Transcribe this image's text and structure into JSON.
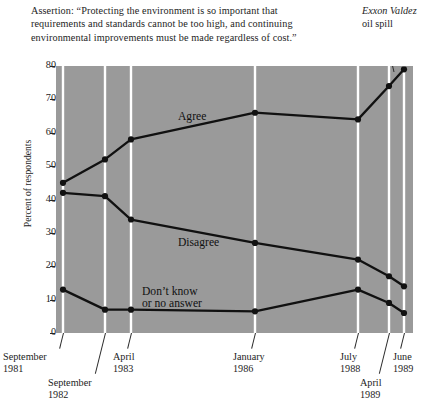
{
  "assertion": {
    "text": "Assertion: “Protecting the environment is so important that requirements and standards cannot be too high, and continuing environmental improvements must be made regardless of cost.”"
  },
  "annotation": {
    "title_italic": "Exxon Valdez",
    "title_rest": "oil spill"
  },
  "chart_data": {
    "type": "line",
    "title": "",
    "xlabel": "",
    "ylabel": "Percent of respondents",
    "ylim": [
      0,
      80
    ],
    "yticks": [
      0,
      10,
      20,
      30,
      40,
      50,
      60,
      70,
      80
    ],
    "grid": "vertical-white-gridlines",
    "legend": "inline-labels",
    "plot_background": "#9a9a9a",
    "line_color": "#111111",
    "gridline_color": "#ffffff",
    "categories": [
      "September 1981",
      "September 1982",
      "April 1983",
      "January 1986",
      "July 1988",
      "April 1989",
      "June 1989"
    ],
    "x_positions_px": [
      7,
      49,
      75,
      199,
      302,
      333,
      348
    ],
    "series": [
      {
        "name": "Agree",
        "label": "Agree",
        "values": [
          45,
          52,
          58,
          66,
          64,
          74,
          79
        ]
      },
      {
        "name": "Disagree",
        "label": "Disagree",
        "values": [
          42,
          41,
          34,
          27,
          22,
          17,
          14
        ]
      },
      {
        "name": "Don't know or no answer",
        "label_line1": "Don’t know",
        "label_line2": "or no answer",
        "values": [
          13,
          7,
          7,
          6.5,
          13,
          9,
          6
        ]
      }
    ],
    "annotations": [
      {
        "text": "Exxon Valdez oil spill",
        "points_to": "April 1989"
      }
    ]
  },
  "xaxis": {
    "labels": [
      {
        "line1": "September",
        "line2": "1981"
      },
      {
        "line1": "September",
        "line2": "1982"
      },
      {
        "line1": "April",
        "line2": "1983"
      },
      {
        "line1": "January",
        "line2": "1986"
      },
      {
        "line1": "July",
        "line2": "1988"
      },
      {
        "line1": "April",
        "line2": "1989"
      },
      {
        "line1": "June",
        "line2": "1989"
      }
    ]
  }
}
